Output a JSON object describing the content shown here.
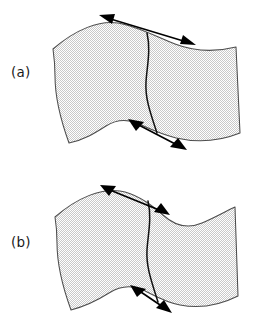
{
  "figure": {
    "background_color": "#ffffff",
    "sheet_fill_color": "#e4e4e4",
    "sheet_outline_color": "#4d4d4d",
    "fold_curve_color": "#111111",
    "arrow_color": "#000000",
    "panels": [
      {
        "id": "a",
        "label": "(a)",
        "sheet_name": "curved-sheet-a",
        "fold_name": "fold-curve-a",
        "arrows": [
          {
            "name": "top-double-arrow-a",
            "style": "double-headed"
          },
          {
            "name": "bottom-double-arrow-a",
            "style": "double-headed"
          }
        ]
      },
      {
        "id": "b",
        "label": "(b)",
        "sheet_name": "curved-sheet-b",
        "fold_name": "fold-curve-b",
        "arrows": [
          {
            "name": "top-double-arrow-b",
            "style": "double-headed"
          },
          {
            "name": "bottom-double-arrow-b",
            "style": "double-headed"
          }
        ]
      }
    ]
  }
}
